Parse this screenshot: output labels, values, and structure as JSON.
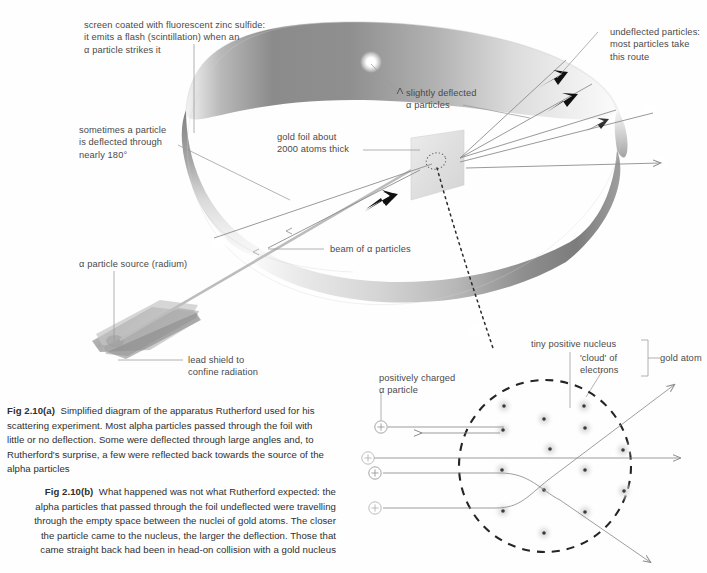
{
  "figure": {
    "id_a": "Fig 2.10(a)",
    "id_b": "Fig 2.10(b)",
    "caption_a": "Simplified diagram of the apparatus Rutherford used for his scattering experiment. Most alpha particles passed through the foil with little or no deflection. Some were deflected through large angles and, to Rutherford's surprise, a few were reflected back towards the source of the alpha particles",
    "caption_b": "What happened was not what Rutherford expected: the alpha particles that passed through the foil undeflected were travelling through the empty space between the nuclei of gold atoms. The closer the particle came to the nucleus, the larger the deflection. Those that came straight back had been in head-on collision with a gold nucleus"
  },
  "labels": {
    "screen": "screen coated with fluorescent zinc sulfide:\nit emits a flash (scintillation) when an\nα particle strikes it",
    "back_scatter": "sometimes a particle\nis deflected through\nnearly 180°",
    "source": "α particle source (radium)",
    "lead_shield": "lead shield to\nconfine radiation",
    "gold_foil": "gold foil about\n2000 atoms thick",
    "slightly_deflected": "slightly deflected\nα particles",
    "undeflected": "undeflected particles:\nmost particles take\nthis route",
    "beam": "beam of α particles",
    "nucleus": "tiny positive nucleus",
    "electron_cloud": "'cloud' of\nelectrons",
    "gold_atom": "gold atom",
    "alpha_particle": "positively charged\nα particle"
  },
  "colors": {
    "ink": "#4a4a4a",
    "caption_ink": "#2f2f2f",
    "ring_dark": "#6e6e6e",
    "ring_mid": "#9a9a9a",
    "ring_light": "#d8d8d8",
    "foil": "#e2e2e2",
    "leader": "#8d8d8d",
    "beam": "#b9b9b9",
    "dashed": "#2b2b2b",
    "nucleus_halo": "#e6e6e6",
    "background": "#ffffff"
  },
  "diagram": {
    "ring_label": "scintillation screen ring",
    "flash_count": 5,
    "nuclei_rows": 5,
    "nuclei_total": 17,
    "alpha_particle_glyph": "+",
    "alpha_particle_count": 4,
    "trajectory_notes": [
      "beam from source through lead shield to gold foil",
      "undeflected particles continue straight right",
      "slightly deflected particles fan upward-right",
      "one particle reflected nearly 180 degrees back to left",
      "dotted line links foil to magnified gold atom"
    ]
  }
}
